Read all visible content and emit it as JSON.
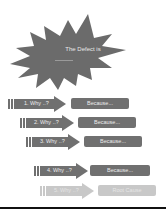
{
  "diagram": {
    "defect": {
      "label": "The Defect is",
      "color": "#6b6b6b"
    },
    "rows": [
      {
        "why": "1. Why ..?",
        "because": "Because...",
        "color": "#707070",
        "box_color": "#707070"
      },
      {
        "why": "2. Why ..?",
        "because": "Because...",
        "color": "#707070",
        "box_color": "#707070"
      },
      {
        "why": "3. Why ..?",
        "because": "Because...",
        "color": "#707070",
        "box_color": "#707070"
      },
      {
        "why": "4. Why ..?",
        "because": "Because...",
        "color": "#707070",
        "box_color": "#707070"
      },
      {
        "why": "5. Why ..?",
        "because": "Root Cause",
        "color": "#c8c8c8",
        "box_color": "#c8c8c8"
      }
    ]
  }
}
